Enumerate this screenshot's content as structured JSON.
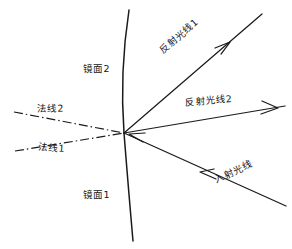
{
  "diagram": {
    "background_color": "#ffffff",
    "stroke_color": "#1a1a1a",
    "width": 292,
    "height": 249,
    "intersection_point": {
      "x": 124,
      "y": 133
    },
    "labels": {
      "mirror_2": "镜面2",
      "mirror_1": "镜面1",
      "normal_2": "法线2",
      "normal_1": "法线1",
      "reflected_ray_1": "反射光线1",
      "reflected_ray_2": "反射光线2",
      "incident_ray": "入射光线"
    },
    "elements": [
      {
        "name": "mirror-surface-line",
        "kind": "solid-curve",
        "description": "near-vertical slightly bowed line splitting mirror 2 (upper) from mirror 1 (lower)",
        "path": "M 129 10 Q 120 72 124 133 Q 128 190 133 241"
      },
      {
        "name": "reflected-ray-1-line",
        "kind": "solid-arrow",
        "from": {
          "x": 124,
          "y": 133
        },
        "to": {
          "x": 262,
          "y": 14
        },
        "arrow_at": {
          "x": 228,
          "y": 43
        },
        "arrow_direction": "up-right"
      },
      {
        "name": "reflected-ray-2-line",
        "kind": "solid-arrow",
        "from": {
          "x": 124,
          "y": 133
        },
        "to": {
          "x": 284,
          "y": 106
        },
        "arrow_at": {
          "x": 274,
          "y": 108
        },
        "arrow_direction": "right"
      },
      {
        "name": "incident-ray-line",
        "kind": "solid-arrow",
        "from": {
          "x": 286,
          "y": 206
        },
        "to": {
          "x": 124,
          "y": 133
        },
        "arrow_at": {
          "x": 140,
          "y": 140
        },
        "arrow_direction": "up-left"
      },
      {
        "name": "normal-line-2",
        "kind": "dash-dot",
        "from": {
          "x": 14,
          "y": 112
        },
        "to": {
          "x": 124,
          "y": 133
        }
      },
      {
        "name": "normal-line-1",
        "kind": "dash-dot",
        "from": {
          "x": 15,
          "y": 151
        },
        "to": {
          "x": 124,
          "y": 133
        }
      }
    ]
  }
}
